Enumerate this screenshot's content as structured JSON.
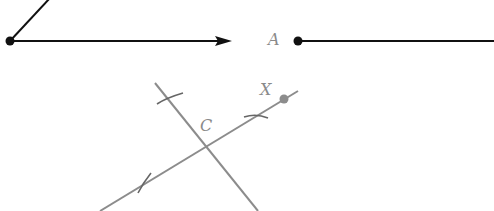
{
  "figure": {
    "labels": {
      "A": "A",
      "C": "C",
      "X": "X"
    },
    "colors": {
      "construction_ink": "#111111",
      "construction_gray": "#8c8c8c",
      "label_gray": "#8a8a8a",
      "background": "#ffffff"
    },
    "elements": {
      "angle_vertex": {
        "x": 10,
        "y": 41
      },
      "angle_ray_up_end": {
        "x": 50,
        "y": -2
      },
      "angle_ray_right_end": {
        "x": 232,
        "y": 41
      },
      "point_A": {
        "x": 298,
        "y": 41
      },
      "ray_A_end": {
        "x": 494,
        "y": 41
      },
      "line_through_X": {
        "x1": 100,
        "y1": 211,
        "x2": 298,
        "y2": 91
      },
      "perpendicular_line": {
        "x1": 155,
        "y1": 83,
        "x2": 258,
        "y2": 211
      },
      "point_X": {
        "x": 284,
        "y": 99
      },
      "intersection_C": {
        "x": 206,
        "y": 147
      }
    }
  }
}
